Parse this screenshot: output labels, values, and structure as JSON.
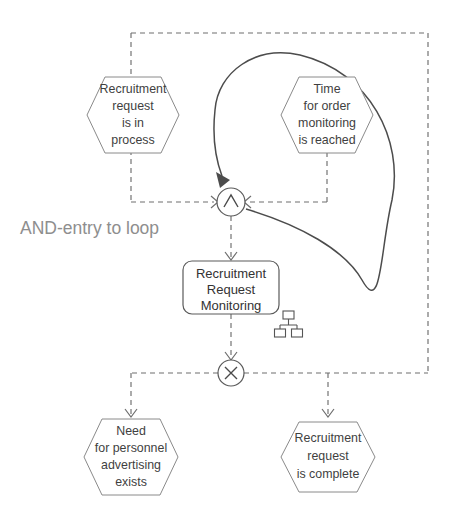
{
  "diagram": {
    "type": "event-driven-process-chain",
    "title": "AND-entry to loop",
    "annotations": [
      {
        "id": "and-entry-annotation",
        "label": "AND-entry to loop",
        "color": "#8e8e8e",
        "x": 20,
        "y": 234
      }
    ],
    "colors": {
      "shape_outline": "#5a5a5a",
      "event_outline": "#8a8a8a",
      "flow_dashed": "#6e6e6e",
      "loop_curve": "#4c4c4c",
      "text": "#3a3a3a",
      "annotation": "#8e8e8e",
      "background": "#ffffff"
    },
    "events": [
      {
        "id": "event-recruitment-request-in-process",
        "name": "recruitment-request-in-process",
        "lines": [
          "Recruitment",
          "request",
          "is in",
          "process"
        ],
        "cx": 133,
        "cy": 115,
        "w": 92,
        "h": 76
      },
      {
        "id": "event-time-for-order-monitoring-reached",
        "name": "time-for-order-monitoring-reached",
        "lines": [
          "Time",
          "for order",
          "monitoring",
          "is reached"
        ],
        "cx": 327,
        "cy": 115,
        "w": 92,
        "h": 76
      },
      {
        "id": "event-need-for-personnel-advertising-exists",
        "name": "need-for-personnel-advertising-exists",
        "lines": [
          "Need",
          "for personnel",
          "advertising",
          "exists"
        ],
        "cx": 131,
        "cy": 457,
        "w": 94,
        "h": 76
      },
      {
        "id": "event-recruitment-request-complete",
        "name": "recruitment-request-complete",
        "lines": [
          "Recruitment",
          "request",
          "is complete"
        ],
        "cx": 328,
        "cy": 457,
        "w": 94,
        "h": 70
      }
    ],
    "functions": [
      {
        "id": "function-recruitment-request-monitoring",
        "name": "recruitment-request-monitoring",
        "lines": [
          "Recruitment",
          "Request",
          "Monitoring"
        ],
        "x": 183,
        "y": 261,
        "w": 96,
        "h": 53,
        "rx": 9
      }
    ],
    "connectors": [
      {
        "id": "connector-and",
        "name": "and-connector",
        "operator": "AND",
        "glyph": "∧",
        "cx": 231,
        "cy": 202,
        "r": 14
      },
      {
        "id": "connector-xor",
        "name": "xor-connector",
        "operator": "XOR",
        "glyph": "×",
        "cx": 231,
        "cy": 373,
        "r": 13
      }
    ],
    "icons": [
      {
        "id": "org-unit-icon",
        "name": "organizational-chart-icon",
        "x": 277,
        "y": 311,
        "w": 22,
        "h": 26
      }
    ],
    "loop": {
      "id": "process-loop",
      "name": "loop-back-arrow",
      "description": "Loop from Recruitment Request Monitoring back to AND connector"
    },
    "frame": {
      "id": "dashed-frame",
      "name": "control-flow-frame",
      "left": 131,
      "top": 33,
      "right": 428,
      "bottom": 373
    }
  }
}
